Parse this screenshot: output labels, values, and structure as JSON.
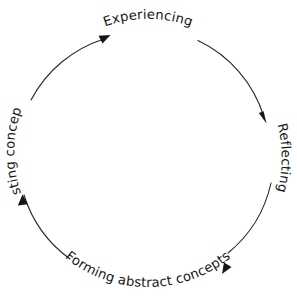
{
  "diagram": {
    "type": "cycle-diagram",
    "direction": "clockwise",
    "background_color": "#ffffff",
    "stroke_color": "#2b2b2b",
    "text_color": "#171717",
    "center": {
      "x": 148,
      "y": 152
    },
    "radius": 125,
    "stages": [
      {
        "id": "experiencing",
        "label": "Experiencing",
        "position": "top",
        "order": 1,
        "text_rotation_deg": 0,
        "arc_midpoint_angle_deg": 270
      },
      {
        "id": "reflecting",
        "label": "Reflecting",
        "position": "right",
        "order": 2,
        "text_rotation_deg": 90,
        "arc_midpoint_angle_deg": 0
      },
      {
        "id": "forming-abstract-concepts",
        "label": "Forming abstract concepts",
        "position": "bottom",
        "order": 3,
        "text_rotation_deg": 0,
        "arc_midpoint_angle_deg": 90
      },
      {
        "id": "testing-concepts",
        "label": "Testing concepts",
        "position": "left",
        "order": 4,
        "text_rotation_deg": -90,
        "arc_midpoint_angle_deg": 180
      }
    ],
    "arrows": [
      {
        "id": "arrow-to-experiencing",
        "points_to": "experiencing",
        "tip": {
          "x": 108,
          "y": 37
        },
        "direction_deg": 300
      },
      {
        "id": "arrow-to-reflecting",
        "points_to": "reflecting",
        "tip": {
          "x": 265,
          "y": 121
        },
        "direction_deg": 30
      },
      {
        "id": "arrow-to-forming-abstract-concepts",
        "points_to": "forming-abstract-concepts",
        "tip": {
          "x": 224,
          "y": 272
        },
        "direction_deg": 120
      },
      {
        "id": "arrow-to-testing-concepts",
        "points_to": "testing-concepts",
        "tip": {
          "x": 22,
          "y": 199
        },
        "direction_deg": 210
      }
    ]
  }
}
